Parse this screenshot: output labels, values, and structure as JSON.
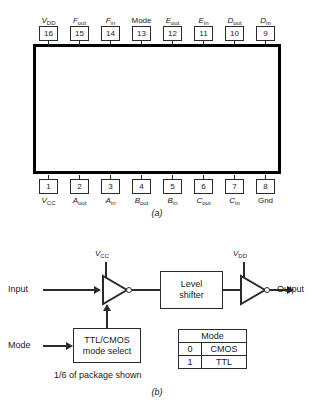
{
  "figure_a": {
    "caption": "(a)",
    "package_type": "16-pin DIP",
    "pins_top": [
      {
        "number": "16",
        "name_main": "V",
        "name_sub": "DD",
        "italic": true
      },
      {
        "number": "15",
        "name_main": "F",
        "name_sub": "out",
        "italic": true
      },
      {
        "number": "14",
        "name_main": "F",
        "name_sub": "in",
        "italic": true
      },
      {
        "number": "13",
        "name_main": "Mode",
        "name_sub": "",
        "italic": false
      },
      {
        "number": "12",
        "name_main": "E",
        "name_sub": "out",
        "italic": true
      },
      {
        "number": "11",
        "name_main": "E",
        "name_sub": "in",
        "italic": true
      },
      {
        "number": "10",
        "name_main": "D",
        "name_sub": "out",
        "italic": true
      },
      {
        "number": "9",
        "name_main": "D",
        "name_sub": "in",
        "italic": true
      }
    ],
    "pins_bottom": [
      {
        "number": "1",
        "name_main": "V",
        "name_sub": "CC",
        "italic": true
      },
      {
        "number": "2",
        "name_main": "A",
        "name_sub": "out",
        "italic": true
      },
      {
        "number": "3",
        "name_main": "A",
        "name_sub": "in",
        "italic": true
      },
      {
        "number": "4",
        "name_main": "B",
        "name_sub": "out",
        "italic": true
      },
      {
        "number": "5",
        "name_main": "B",
        "name_sub": "in",
        "italic": true
      },
      {
        "number": "6",
        "name_main": "C",
        "name_sub": "out",
        "italic": true
      },
      {
        "number": "7",
        "name_main": "C",
        "name_sub": "in",
        "italic": true
      },
      {
        "number": "8",
        "name_main": "Gnd",
        "name_sub": "",
        "italic": false
      }
    ]
  },
  "figure_b": {
    "caption": "(b)",
    "input_label": "Input",
    "output_label": "Output",
    "mode_label": "Mode",
    "vcc_main": "V",
    "vcc_sub": "CC",
    "vdd_main": "V",
    "vdd_sub": "DD",
    "level_shifter_line1": "Level",
    "level_shifter_line2": "shifter",
    "mode_select_line1": "TTL/CMOS",
    "mode_select_line2": "mode select",
    "note": "1/6 of package shown",
    "mode_table": {
      "header": "Mode",
      "rows": [
        {
          "value": "0",
          "name": "CMOS"
        },
        {
          "value": "1",
          "name": "TTL"
        }
      ]
    }
  }
}
